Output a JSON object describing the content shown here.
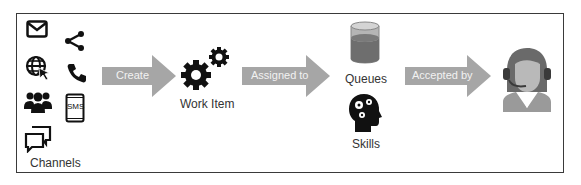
{
  "diagram": {
    "nodes": [
      {
        "id": "channels",
        "label": "Channels",
        "icons": [
          "email-icon",
          "share-icon",
          "web-icon",
          "phone-icon",
          "group-icon",
          "sms-tablet-icon",
          "chat-icon"
        ]
      },
      {
        "id": "work-item",
        "label": "Work Item",
        "icon": "gears-icon"
      },
      {
        "id": "queues",
        "label": "Queues",
        "icon": "database-cylinder-icon"
      },
      {
        "id": "skills",
        "label": "Skills",
        "icon": "head-gears-icon"
      },
      {
        "id": "agent",
        "label": "",
        "icon": "agent-headset-icon"
      }
    ],
    "edges": [
      {
        "from": "channels",
        "to": "work-item",
        "label": "Create"
      },
      {
        "from": "work-item",
        "to": "queues",
        "label": "Assigned to"
      },
      {
        "from": "queues",
        "to": "agent",
        "label": "Accepted by"
      }
    ],
    "sms_text": "SMS"
  },
  "colors": {
    "arrow_fill": "#a6a6a6",
    "arrow_text": "#f2f2f2",
    "icon_dark": "#111111",
    "frame": "#3a3a3a",
    "queue_liquid": "#6e6e6e",
    "queue_glass": "#b5b5b5",
    "agent_hair": "#6a6a6a",
    "agent_skin": "#b9b9b9"
  }
}
